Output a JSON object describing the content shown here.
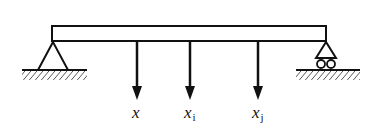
{
  "diagram": {
    "type": "simply-supported-beam",
    "beam": {
      "x1": 52,
      "x2": 326,
      "y_top": 26,
      "y_bottom": 41
    },
    "supports": [
      {
        "name": "pin-support",
        "kind": "pin",
        "x": 53
      },
      {
        "name": "roller-support",
        "kind": "roller",
        "x": 326
      }
    ],
    "loads": [
      {
        "label": "x",
        "subscript": "",
        "x": 137
      },
      {
        "label": "x",
        "subscript": "i",
        "x": 190
      },
      {
        "label": "x",
        "subscript": "j",
        "x": 258
      }
    ],
    "colors": {
      "stroke": "#111111",
      "background": "#ffffff"
    }
  }
}
